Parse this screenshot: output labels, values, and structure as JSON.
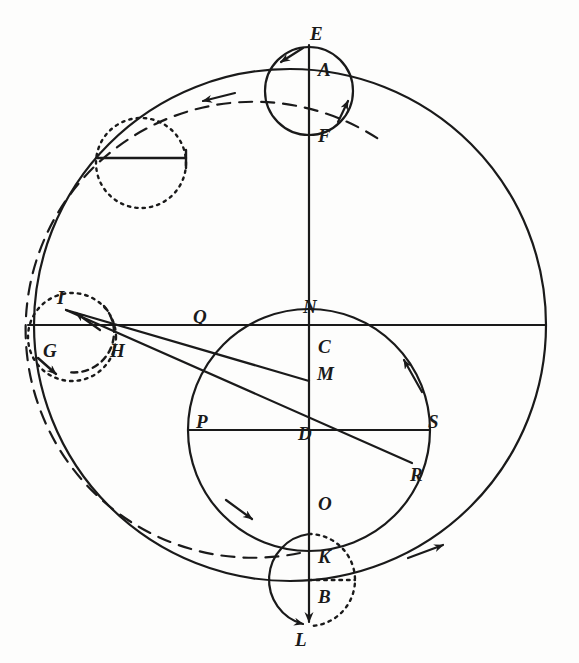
{
  "figure": {
    "background_color": "#fdfdfc",
    "stroke_color": "#1a1a1a"
  },
  "labels": [
    {
      "id": "E",
      "text": "E",
      "x": 310,
      "y": 24
    },
    {
      "id": "A",
      "text": "A",
      "x": 318,
      "y": 60
    },
    {
      "id": "F",
      "text": "F",
      "x": 318,
      "y": 126
    },
    {
      "id": "I",
      "text": "I",
      "x": 57,
      "y": 288
    },
    {
      "id": "Q",
      "text": "Q",
      "x": 193,
      "y": 307
    },
    {
      "id": "N",
      "text": "N",
      "x": 303,
      "y": 297
    },
    {
      "id": "C",
      "text": "C",
      "x": 318,
      "y": 337
    },
    {
      "id": "G",
      "text": "G",
      "x": 43,
      "y": 341
    },
    {
      "id": "H",
      "text": "H",
      "x": 110,
      "y": 341
    },
    {
      "id": "M",
      "text": "M",
      "x": 317,
      "y": 364
    },
    {
      "id": "P",
      "text": "P",
      "x": 196,
      "y": 412
    },
    {
      "id": "D",
      "text": "D",
      "x": 298,
      "y": 424
    },
    {
      "id": "S",
      "text": "S",
      "x": 428,
      "y": 412
    },
    {
      "id": "R",
      "text": "R",
      "x": 410,
      "y": 465
    },
    {
      "id": "O",
      "text": "O",
      "x": 318,
      "y": 494
    },
    {
      "id": "K",
      "text": "K",
      "x": 318,
      "y": 547
    },
    {
      "id": "B",
      "text": "B",
      "x": 318,
      "y": 587
    },
    {
      "id": "L",
      "text": "L",
      "x": 295,
      "y": 630
    }
  ],
  "geometry": {
    "outer_circle": {
      "cx": 290,
      "cy": 325,
      "r": 256,
      "style": "solid"
    },
    "inner_circle": {
      "cx": 309,
      "cy": 430,
      "r": 121,
      "style": "solid"
    },
    "epicycle_top": {
      "cx": 309,
      "cy": 91,
      "r": 44,
      "style": "solid"
    },
    "epicycle_bottom": {
      "cx": 309,
      "cy": 580,
      "r": 46,
      "style": "half-solid-half-dotted"
    },
    "epicycle_left": {
      "cx": 72,
      "cy": 337,
      "r": 44,
      "style": "dotted"
    },
    "epicycle_upper_left": {
      "cx": 141,
      "cy": 163,
      "r": 45,
      "style": "dotted"
    },
    "vertical_axis": {
      "x": 309,
      "y1": 45,
      "y2": 625
    },
    "horizontal_axis": {
      "y": 325,
      "x1": 28,
      "x2": 546
    },
    "dashed_arc": {
      "cx": 290,
      "cy": 325,
      "r": 228,
      "style": "dashed"
    },
    "chord_I_to_M": {
      "x1": 68,
      "y1": 311,
      "x2": 309,
      "y2": 380
    },
    "chord_I_to_R": {
      "x1": 68,
      "y1": 311,
      "x2": 412,
      "y2": 463
    }
  },
  "arrows": [
    {
      "id": "outer-arc-top-left",
      "direction": "counterclockwise",
      "x": 203,
      "y": 101
    },
    {
      "id": "outer-arc-bottom-right",
      "direction": "counterclockwise",
      "x": 437,
      "y": 548
    },
    {
      "id": "epicycle-top-left",
      "direction": "counterclockwise",
      "x": 283,
      "y": 61
    },
    {
      "id": "epicycle-top-right",
      "direction": "clockwise",
      "x": 343,
      "y": 107
    },
    {
      "id": "epicycle-left-bottom",
      "direction": "clockwise",
      "x": 57,
      "y": 373
    },
    {
      "id": "inner-circle-right",
      "direction": "counterclockwise",
      "x": 398,
      "y": 362
    },
    {
      "id": "inner-circle-bottom-left",
      "direction": "counterclockwise",
      "x": 245,
      "y": 487
    },
    {
      "id": "epicycle-bottom-left",
      "direction": "clockwise",
      "x": 300,
      "y": 622
    },
    {
      "id": "chord-arrow-I",
      "direction": "toward-I",
      "x": 82,
      "y": 318
    },
    {
      "id": "vertical-axis-bottom",
      "direction": "down",
      "x": 309,
      "y": 620
    }
  ]
}
